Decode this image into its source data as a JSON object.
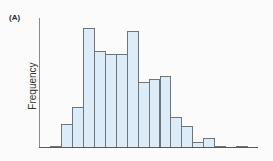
{
  "figure": {
    "panel_label": "(A)"
  },
  "chart_data": {
    "type": "bar",
    "subtype": "histogram",
    "title": "",
    "panel_label": "(A)",
    "xlabel": "",
    "ylabel": "Frequency",
    "x_ticks": [],
    "y_ticks": [],
    "grid": false,
    "legend": null,
    "bar_fill_color": "#dcecf8",
    "bar_edge_color": "#6f7478",
    "bins": [
      1,
      2,
      3,
      4,
      5,
      6,
      7,
      8,
      9,
      10,
      11,
      12,
      13,
      14,
      15,
      16,
      17,
      18
    ],
    "values": [
      1.5,
      20,
      34,
      100,
      81,
      78.5,
      78.5,
      97.5,
      55,
      57.5,
      60,
      25.5,
      18,
      4.5,
      8,
      1.5,
      0,
      1.5
    ],
    "values_note": "Relative heights (tallest bar = 100); no numeric y-axis ticks are shown",
    "ylim": [
      0,
      110
    ]
  }
}
